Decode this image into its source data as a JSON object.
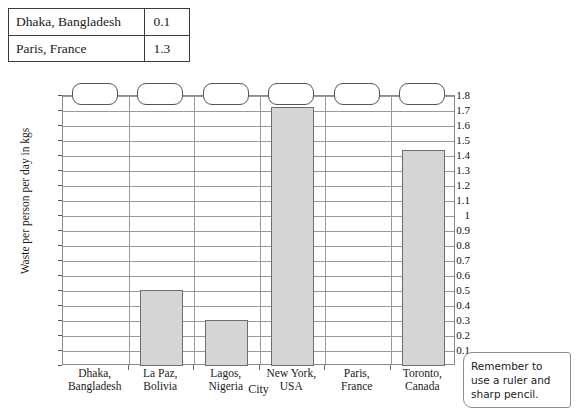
{
  "given_table": {
    "rows": [
      {
        "city": "Dhaka, Bangladesh",
        "value": "0.1"
      },
      {
        "city": "Paris, France",
        "value": "1.3"
      }
    ]
  },
  "note": {
    "text": "Remember to use a ruler and sharp pencil."
  },
  "chart_data": {
    "type": "bar",
    "title": "",
    "xlabel": "City",
    "ylabel": "Waste per person per day in kgs",
    "ylim": [
      0,
      1.8
    ],
    "ytick_step": 0.1,
    "grid": true,
    "legend": "none",
    "categories": [
      "Dhaka, Bangladesh",
      "La Paz, Bolivia",
      "Lagos, Nigeria",
      "New York, USA",
      "Paris, France",
      "Toronto, Canada"
    ],
    "category_lines": [
      [
        "Dhaka,",
        "Bangladesh"
      ],
      [
        "La Paz,",
        "Bolivia"
      ],
      [
        "Lagos,",
        "Nigeria"
      ],
      [
        "New York,",
        "USA"
      ],
      [
        "Paris,",
        "France"
      ],
      [
        "Toronto,",
        "Canada"
      ]
    ],
    "values": [
      null,
      0.51,
      0.31,
      1.73,
      null,
      1.44
    ],
    "ytick_labels": [
      "0",
      "0.1",
      "0.2",
      "0.3",
      "0.4",
      "0.5",
      "0.6",
      "0.7",
      "0.8",
      "0.9",
      "1",
      "1.1",
      "1.2",
      "1.3",
      "1.4",
      "1.5",
      "1.6",
      "1.7",
      "1.8"
    ],
    "answer_boxes": [
      "",
      "",
      "",
      "",
      "",
      ""
    ],
    "bar_fill": "#d5d5d5",
    "bar_stroke": "#6d6d6d",
    "grid_color": "#9a9a9a"
  }
}
